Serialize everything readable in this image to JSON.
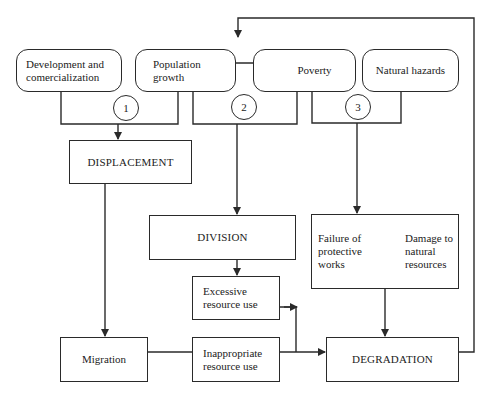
{
  "diagram": {
    "causes": [
      {
        "id": "development",
        "label": "Development and comercialization"
      },
      {
        "id": "population",
        "label": "Population growth"
      },
      {
        "id": "poverty",
        "label": "Poverty"
      },
      {
        "id": "hazards",
        "label": "Natural hazards"
      }
    ],
    "markers": [
      "1",
      "2",
      "3"
    ],
    "processes": {
      "displacement": "DISPLACEMENT",
      "division": "DIVISION",
      "degradation": "DEGRADATION"
    },
    "effects": {
      "migration": "Migration",
      "excessive": "Excessive resource use",
      "inappropriate": "Inappropriate resource use",
      "failure": "Failure of protective works",
      "damage": "Damage to natural resources"
    },
    "colors": {
      "line": "#2a2a2a",
      "background": "#ffffff"
    }
  }
}
